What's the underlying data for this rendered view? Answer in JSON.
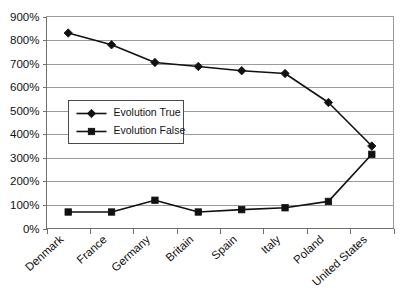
{
  "chart_data": {
    "type": "line",
    "title": "",
    "subtitle": "",
    "xlabel": "",
    "ylabel": "",
    "ylim": [
      0,
      900
    ],
    "y_tick_step": 100,
    "y_unit": "%",
    "grid": true,
    "legend_position": "inside-left",
    "categories": [
      "Denmark",
      "France",
      "Germany",
      "Britain",
      "Spain",
      "Italy",
      "Poland",
      "United States"
    ],
    "y_tick_labels": [
      "900%",
      "800%",
      "700%",
      "600%",
      "500%",
      "400%",
      "300%",
      "200%",
      "100%",
      "0%"
    ],
    "series": [
      {
        "name": "Evolution True",
        "marker": "diamond",
        "color": "#111111",
        "values": [
          830,
          780,
          705,
          688,
          670,
          658,
          535,
          350
        ]
      },
      {
        "name": "Evolution False",
        "marker": "square",
        "color": "#111111",
        "values": [
          70,
          70,
          120,
          70,
          80,
          88,
          115,
          315
        ]
      }
    ]
  }
}
